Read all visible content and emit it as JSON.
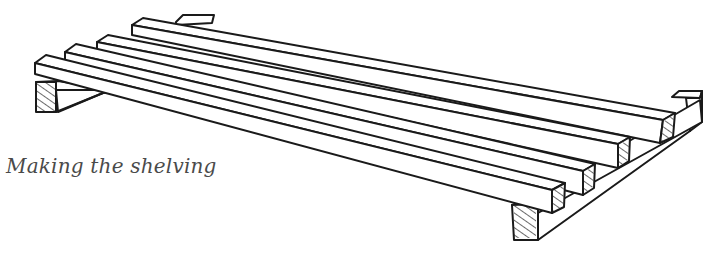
{
  "figure": {
    "caption": "Making the shelving",
    "components": {
      "slats": 4,
      "cross_battens": 2
    },
    "colors": {
      "ink": "#1a1a1a",
      "caption": "#4a4a4a",
      "background": "#ffffff"
    }
  }
}
